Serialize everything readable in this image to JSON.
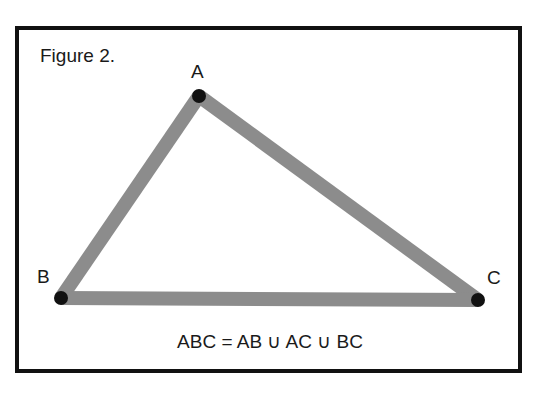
{
  "figure": {
    "caption": "Figure 2.",
    "equation": "ABC = AB ∪ AC ∪ BC",
    "colors": {
      "frame": "#111111",
      "segments": "#8c8c8c",
      "points": "#111111",
      "background": "#ffffff"
    },
    "points": [
      {
        "name": "A",
        "x": 199,
        "y": 96
      },
      {
        "name": "B",
        "x": 61,
        "y": 298
      },
      {
        "name": "C",
        "x": 478,
        "y": 300
      }
    ],
    "segments": [
      "AB",
      "AC",
      "BC"
    ]
  }
}
